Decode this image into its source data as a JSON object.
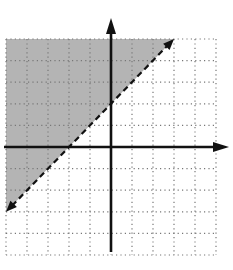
{
  "chart_data": {
    "type": "inequality-graph",
    "title": "",
    "xlabel": "",
    "ylabel": "",
    "xlim": [
      -5,
      5
    ],
    "ylim": [
      -5,
      5
    ],
    "grid": true,
    "grid_style": "dotted",
    "boundary_line": {
      "equation": "y = x + 2",
      "slope": 1,
      "intercept": 2,
      "style": "dashed",
      "points": [
        [
          -5,
          -3
        ],
        [
          3,
          5
        ]
      ]
    },
    "shaded_region": "above",
    "inequality": "y > x + 2",
    "shade_color": "#b4b4b4"
  },
  "colors": {
    "axis": "#111111",
    "grid": "#777777",
    "shade": "#b4b4b4",
    "boundary": "#111111",
    "background": "#ffffff"
  }
}
